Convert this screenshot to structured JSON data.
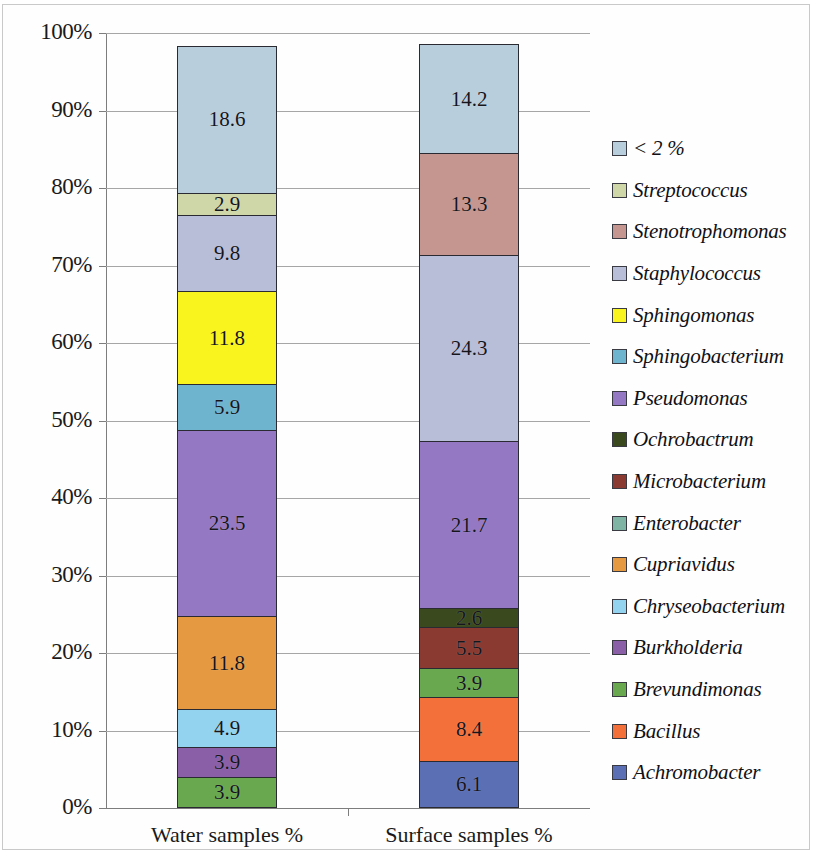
{
  "chart_data": {
    "type": "bar",
    "subtype": "stacked-percentage",
    "title": "",
    "xlabel": "",
    "ylabel": "",
    "ylim": [
      0,
      100
    ],
    "ytick_labels": [
      "0%",
      "10%",
      "20%",
      "30%",
      "40%",
      "50%",
      "60%",
      "70%",
      "80%",
      "90%",
      "100%"
    ],
    "ytick_values": [
      0,
      10,
      20,
      30,
      40,
      50,
      60,
      70,
      80,
      90,
      100
    ],
    "grid": true,
    "legend_position": "right",
    "categories": [
      "Water samples %",
      "Surface samples %"
    ],
    "series": [
      {
        "name": "Achromobacter",
        "color": "#5b6fb4",
        "values": [
          0,
          6.1
        ],
        "labels": [
          "",
          "6.1"
        ]
      },
      {
        "name": "Bacillus",
        "color": "#f4703a",
        "values": [
          0,
          8.4
        ],
        "labels": [
          "",
          "8.4"
        ]
      },
      {
        "name": "Brevundimonas",
        "color": "#6aa84f",
        "values": [
          3.9,
          3.9
        ],
        "labels": [
          "3.9",
          "3.9"
        ]
      },
      {
        "name": "Burkholderia",
        "color": "#8b5fa8",
        "values": [
          3.9,
          0
        ],
        "labels": [
          "3.9",
          ""
        ]
      },
      {
        "name": "Chryseobacterium",
        "color": "#93d3ef",
        "values": [
          4.9,
          0
        ],
        "labels": [
          "4.9",
          ""
        ]
      },
      {
        "name": "Cupriavidus",
        "color": "#e59a42",
        "values": [
          11.8,
          0
        ],
        "labels": [
          "11.8",
          ""
        ]
      },
      {
        "name": "Enterobacter",
        "color": "#7fb3a4",
        "values": [
          0,
          0
        ],
        "labels": [
          "",
          ""
        ]
      },
      {
        "name": "Microbacterium",
        "color": "#8a3a30",
        "values": [
          0,
          5.5
        ],
        "labels": [
          "",
          "5.5"
        ]
      },
      {
        "name": "Ochrobactrum",
        "color": "#3b4a1e",
        "values": [
          0,
          2.6
        ],
        "labels": [
          "",
          "2.6"
        ]
      },
      {
        "name": "Pseudomonas",
        "color": "#9478c4",
        "values": [
          23.5,
          21.7
        ],
        "labels": [
          "23.5",
          "21.7"
        ]
      },
      {
        "name": "Sphingobacterium",
        "color": "#6fb4cf",
        "values": [
          5.9,
          0
        ],
        "labels": [
          "5.9",
          ""
        ]
      },
      {
        "name": "Sphingomonas",
        "color": "#faf41e",
        "values": [
          11.8,
          0
        ],
        "labels": [
          "11.8",
          ""
        ]
      },
      {
        "name": "Staphylococcus",
        "color": "#b8bdd8",
        "values": [
          9.8,
          24.3
        ],
        "labels": [
          "9.8",
          "24.3"
        ]
      },
      {
        "name": "Stenotrophomonas",
        "color": "#c4968f",
        "values": [
          0,
          13.3
        ],
        "labels": [
          "",
          "13.3"
        ]
      },
      {
        "name": "Streptococcus",
        "color": "#cfd7a8",
        "values": [
          2.9,
          0
        ],
        "labels": [
          "2.9",
          ""
        ]
      },
      {
        "name": "< 2 %",
        "color": "#b9cedd",
        "values": [
          18.6,
          14.2
        ],
        "labels": [
          "18.6",
          "14.2"
        ]
      }
    ],
    "stack_order_bottom_to_top": [
      "Achromobacter",
      "Bacillus",
      "Brevundimonas",
      "Burkholderia",
      "Chryseobacterium",
      "Cupriavidus",
      "Enterobacter",
      "Microbacterium",
      "Ochrobactrum",
      "Pseudomonas",
      "Sphingobacterium",
      "Sphingomonas",
      "Staphylococcus",
      "Stenotrophomonas",
      "Streptococcus",
      "< 2 %"
    ],
    "legend_entries_top_to_bottom": [
      {
        "label": "< 2 %",
        "color": "#b9cedd"
      },
      {
        "label": "Streptococcus",
        "color": "#cfd7a8"
      },
      {
        "label": "Stenotrophomonas",
        "color": "#c4968f"
      },
      {
        "label": "Staphylococcus",
        "color": "#b8bdd8"
      },
      {
        "label": "Sphingomonas",
        "color": "#faf41e"
      },
      {
        "label": "Sphingobacterium",
        "color": "#6fb4cf"
      },
      {
        "label": "Pseudomonas",
        "color": "#9478c4"
      },
      {
        "label": "Ochrobactrum",
        "color": "#3b4a1e"
      },
      {
        "label": "Microbacterium",
        "color": "#8a3a30"
      },
      {
        "label": "Enterobacter",
        "color": "#7fb3a4"
      },
      {
        "label": "Cupriavidus",
        "color": "#e59a42"
      },
      {
        "label": "Chryseobacterium",
        "color": "#93d3ef"
      },
      {
        "label": "Burkholderia",
        "color": "#8b5fa8"
      },
      {
        "label": "Brevundimonas",
        "color": "#6aa84f"
      },
      {
        "label": "Bacillus",
        "color": "#f4703a"
      },
      {
        "label": "Achromobacter",
        "color": "#5b6fb4"
      }
    ]
  }
}
